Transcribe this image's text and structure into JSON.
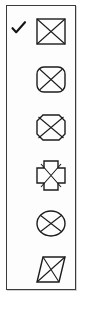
{
  "palette": {
    "name": "Shape style palette",
    "border_color": "#3a3a3a",
    "background_color": "#fdfdfd",
    "stroke_color": "#1c1c1c",
    "selected_index": 0,
    "check_glyph": "✔",
    "items": [
      {
        "label": "Rectangle",
        "icon": "rectangle-with-x-icon",
        "checked": true
      },
      {
        "label": "Rounded rectangle",
        "icon": "rounded-rectangle-with-x-icon",
        "checked": false
      },
      {
        "label": "Octagon",
        "icon": "octagon-with-x-icon",
        "checked": false
      },
      {
        "label": "Cross",
        "icon": "cross-with-x-icon",
        "checked": false
      },
      {
        "label": "Ellipse",
        "icon": "ellipse-with-x-icon",
        "checked": false
      },
      {
        "label": "Parallelogram",
        "icon": "parallelogram-with-x-icon",
        "checked": false
      }
    ]
  }
}
